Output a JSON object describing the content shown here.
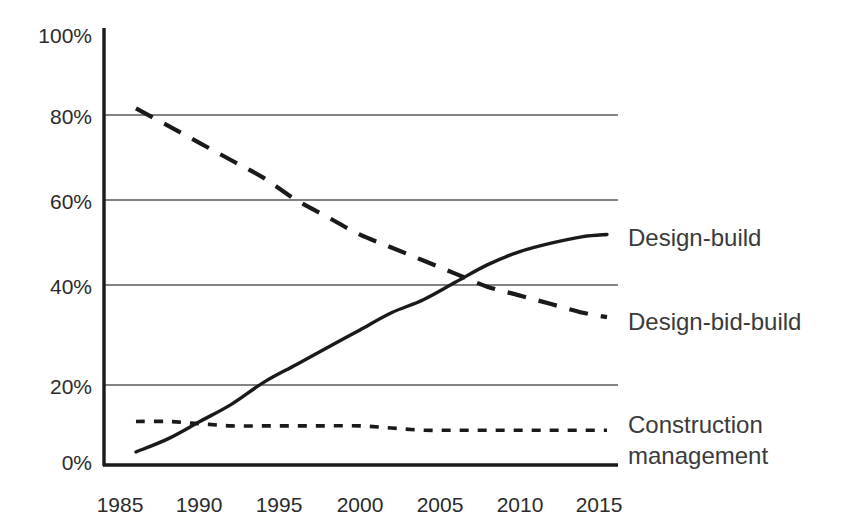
{
  "chart_data": {
    "type": "line",
    "title": "",
    "subtitle": "",
    "xlabel": "",
    "ylabel": "",
    "xlim": [
      1985,
      2016
    ],
    "ylim": [
      0,
      100
    ],
    "grid": "horizontal",
    "legend_position": "right-inline",
    "x_tick_labels": [
      "1985",
      "1990",
      "1995",
      "2000",
      "2005",
      "2010",
      "2015"
    ],
    "x_ticks": [
      1985,
      1990,
      1995,
      2000,
      2005,
      2010,
      2015
    ],
    "y_tick_labels": [
      "0%",
      "20%",
      "40%",
      "60%",
      "80%",
      "100%"
    ],
    "y_ticks": [
      0,
      20,
      40,
      60,
      80,
      100
    ],
    "series": [
      {
        "name": "Design-build",
        "style": "solid",
        "x": [
          1986,
          1988,
          1990,
          1992,
          1994,
          1996,
          1998,
          2000,
          2002,
          2004,
          2006,
          2008,
          2010,
          2012,
          2014,
          2015.5
        ],
        "values": [
          3,
          6,
          10,
          14,
          19,
          23,
          27,
          31,
          35,
          38,
          42,
          46,
          49,
          51,
          52.5,
          53
        ]
      },
      {
        "name": "Design-bid-build",
        "style": "dashed",
        "x": [
          1986,
          1988,
          1990,
          1992,
          1994,
          1996,
          1998,
          2000,
          2002,
          2004,
          2006,
          2008,
          2010,
          2012,
          2014,
          2015.5
        ],
        "values": [
          82,
          78,
          74,
          70,
          66,
          61,
          57,
          53,
          50,
          47,
          44,
          41,
          39,
          37,
          35,
          34
        ]
      },
      {
        "name": "Construction management",
        "style": "dotted",
        "x": [
          1986,
          1988,
          1990,
          1992,
          1994,
          1996,
          1998,
          2000,
          2002,
          2004,
          2006,
          2008,
          2010,
          2012,
          2014,
          2015.5
        ],
        "values": [
          10,
          10,
          9.5,
          9,
          9,
          9,
          9,
          9,
          8.5,
          8,
          8,
          8,
          8,
          8,
          8,
          8
        ]
      }
    ],
    "annotations": [
      {
        "text": "Design-build",
        "at_x": 2016.5,
        "at_y": 53
      },
      {
        "text": "Design-bid-build",
        "at_x": 2016.5,
        "at_y": 34
      },
      {
        "text": "Construction",
        "at_x": 2016.5,
        "at_y": 12
      },
      {
        "text": "management",
        "at_x": 2016.5,
        "at_y": 5
      }
    ],
    "colors": {
      "line": "#1a1a1a",
      "gridline": "#5a5a5a",
      "axis": "#1a1a1a",
      "text": "#2b2b2b",
      "background": "#ffffff"
    }
  },
  "labels": {
    "y0": "0%",
    "y20": "20%",
    "y40": "40%",
    "y60": "60%",
    "y80": "80%",
    "y100": "100%",
    "x1985": "1985",
    "x1990": "1990",
    "x1995": "1995",
    "x2000": "2000",
    "x2005": "2005",
    "x2010": "2010",
    "x2015": "2015",
    "series_design_build": "Design-build",
    "series_design_bid_build": "Design-bid-build",
    "series_construction_line1": "Construction",
    "series_construction_line2": "management"
  }
}
